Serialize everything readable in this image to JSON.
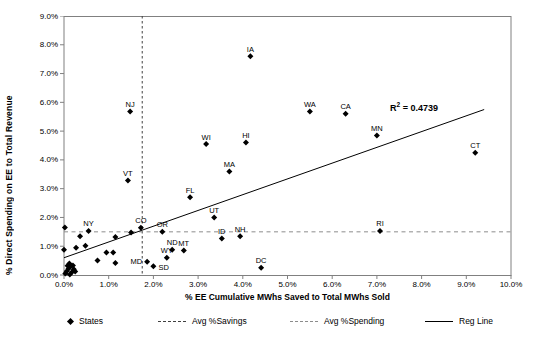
{
  "chart_data": {
    "type": "scatter",
    "title": "",
    "xlabel": "% EE Cumulative MWhs Saved to Total MWhs Sold",
    "ylabel": "% Direct Spending on EE to Total Revenue",
    "xlim": [
      0,
      10
    ],
    "ylim": [
      0,
      9
    ],
    "x_ticks": [
      "0.0%",
      "1.0%",
      "2.0%",
      "3.0%",
      "4.0%",
      "5.0%",
      "6.0%",
      "7.0%",
      "8.0%",
      "9.0%",
      "10.0%"
    ],
    "y_ticks": [
      "0.0%",
      "1.0%",
      "2.0%",
      "3.0%",
      "4.0%",
      "5.0%",
      "6.0%",
      "7.0%",
      "8.0%",
      "9.0%"
    ],
    "annotation": {
      "prefix": "R",
      "sup": "2",
      "rest": " = 0.4739"
    },
    "avg_savings_x": 1.75,
    "avg_spending_y": 1.5,
    "reg_line": {
      "x1": 0,
      "y1": 0.6,
      "x2": 9.4,
      "y2": 5.75
    },
    "colors": {
      "point": "#000000",
      "reg_line": "#000000",
      "avg_savings_line": "#404040",
      "avg_spending_line": "#8c8c8c",
      "plot_border": "#808080"
    },
    "points": [
      {
        "label": "IA",
        "x": 4.17,
        "y": 7.6
      },
      {
        "label": "NJ",
        "x": 1.48,
        "y": 5.68
      },
      {
        "label": "WA",
        "x": 5.5,
        "y": 5.68
      },
      {
        "label": "CA",
        "x": 6.3,
        "y": 5.6
      },
      {
        "label": "MN",
        "x": 7.0,
        "y": 4.85
      },
      {
        "label": "CT",
        "x": 9.2,
        "y": 4.25
      },
      {
        "label": "WI",
        "x": 3.18,
        "y": 4.55
      },
      {
        "label": "HI",
        "x": 4.07,
        "y": 4.6
      },
      {
        "label": "MA",
        "x": 3.7,
        "y": 3.6
      },
      {
        "label": "VT",
        "x": 1.43,
        "y": 3.28
      },
      {
        "label": "FL",
        "x": 2.82,
        "y": 2.7
      },
      {
        "label": "UT",
        "x": 3.36,
        "y": 2.0
      },
      {
        "label": "NY",
        "x": 0.55,
        "y": 1.53
      },
      {
        "label": "CO",
        "x": 1.72,
        "y": 1.64
      },
      {
        "label": "OR",
        "x": 2.2,
        "y": 1.5
      },
      {
        "label": "ID",
        "x": 3.53,
        "y": 1.27
      },
      {
        "label": "NH",
        "x": 3.94,
        "y": 1.35
      },
      {
        "label": "RI",
        "x": 7.07,
        "y": 1.53
      },
      {
        "label": "ND",
        "x": 2.42,
        "y": 0.88
      },
      {
        "label": "MT",
        "x": 2.68,
        "y": 0.85
      },
      {
        "label": "WY",
        "x": 2.3,
        "y": 0.6
      },
      {
        "label": "MD",
        "x": 1.86,
        "y": 0.46,
        "lp": "left"
      },
      {
        "label": "SD",
        "x": 2.0,
        "y": 0.3,
        "lp": "right"
      },
      {
        "label": "DC",
        "x": 4.41,
        "y": 0.25
      },
      {
        "label": "",
        "x": 0.02,
        "y": 1.65
      },
      {
        "label": "",
        "x": 0.36,
        "y": 1.35
      },
      {
        "label": "",
        "x": 1.15,
        "y": 1.32
      },
      {
        "label": "",
        "x": 1.5,
        "y": 1.48
      },
      {
        "label": "",
        "x": 0.0,
        "y": 0.88
      },
      {
        "label": "",
        "x": 0.27,
        "y": 0.95
      },
      {
        "label": "",
        "x": 0.48,
        "y": 1.02
      },
      {
        "label": "",
        "x": 0.95,
        "y": 0.78
      },
      {
        "label": "",
        "x": 1.1,
        "y": 0.78
      },
      {
        "label": "",
        "x": 0.75,
        "y": 0.5
      },
      {
        "label": "",
        "x": 1.15,
        "y": 0.42
      },
      {
        "label": "",
        "x": 0.03,
        "y": 0.05
      },
      {
        "label": "",
        "x": 0.06,
        "y": 0.13
      },
      {
        "label": "",
        "x": 0.1,
        "y": 0.22
      },
      {
        "label": "",
        "x": 0.13,
        "y": 0.02
      },
      {
        "label": "",
        "x": 0.15,
        "y": 0.3
      },
      {
        "label": "",
        "x": 0.18,
        "y": 0.1
      },
      {
        "label": "",
        "x": 0.22,
        "y": 0.2
      },
      {
        "label": "",
        "x": 0.08,
        "y": 0.32
      },
      {
        "label": "",
        "x": 0.25,
        "y": 0.12
      },
      {
        "label": "",
        "x": 0.12,
        "y": 0.4
      },
      {
        "label": "",
        "x": 0.2,
        "y": 0.33
      }
    ]
  },
  "legend": {
    "items": [
      {
        "label": "States",
        "marker": "diamond"
      },
      {
        "label": "Avg %Savings",
        "marker": "dashed-line-dark"
      },
      {
        "label": "Avg %Spending",
        "marker": "dashed-line-gray"
      },
      {
        "label": "Reg Line",
        "marker": "solid-line"
      }
    ]
  }
}
